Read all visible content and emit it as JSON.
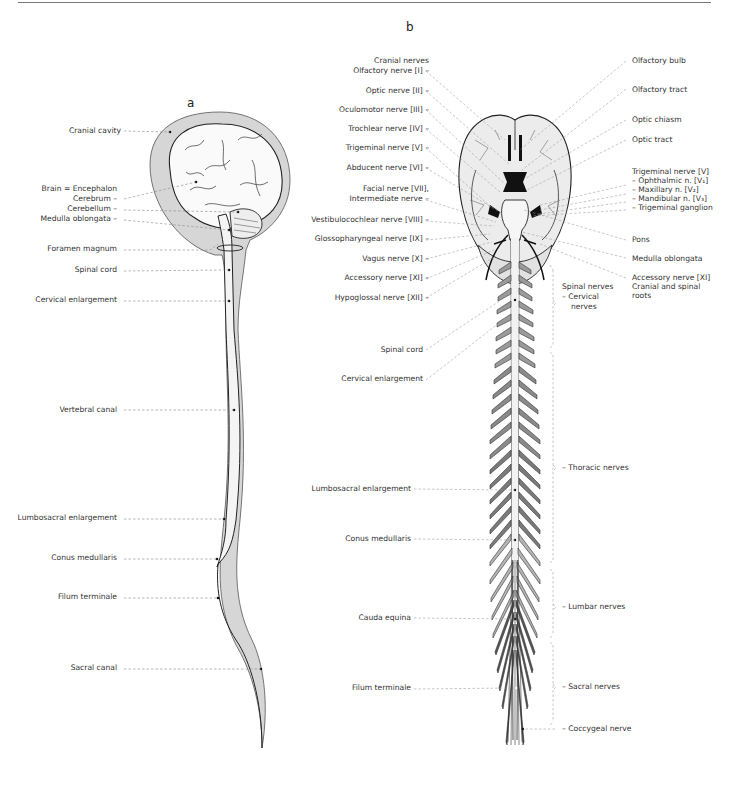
{
  "panels": {
    "a": {
      "letter": "a",
      "labels": {
        "cranial_cavity": "Cranial cavity",
        "brain": "Brain = Encephalon",
        "cerebrum": "Cerebrum –",
        "cerebellum": "Cerebellum –",
        "medulla_oblongata": "Medulla oblongata –",
        "foramen_magnum": "Foramen magnum",
        "spinal_cord": "Spinal cord",
        "cervical_enlargement": "Cervical enlargement",
        "vertebral_canal": "Vertebral canal",
        "lumbosacral_enlargement": "Lumbosacral enlargement",
        "conus_medullaris": "Conus medullaris",
        "filum_terminale": "Filum terminale",
        "sacral_canal": "Sacral canal"
      }
    },
    "b": {
      "letter": "b",
      "left_labels": {
        "cranial_nerves": "Cranial nerves",
        "olfactory": "Olfactory nerve [I] –",
        "optic": "Optic nerve [II] –",
        "oculomotor": "Oculomotor nerve [III] –",
        "trochlear": "Trochlear nerve [IV] –",
        "trigeminal": "Trigeminal nerve [V] –",
        "abducent": "Abducent nerve [VI] –",
        "facial": "Facial nerve [VII],",
        "intermediate": "Intermediate nerve –",
        "vestibulocochlear": "Vestibulocochlear nerve [VIII] –",
        "glossopharyngeal": "Glossopharyngeal nerve [IX] –",
        "vagus": "Vagus nerve [X] –",
        "accessory": "Accessory nerve [XI] –",
        "hypoglossal": "Hypoglossal nerve [XII] –",
        "spinal_cord": "Spinal cord",
        "cervical_enlargement": "Cervical enlargement",
        "lumbosacral_enlargement": "Lumbosacral enlargement",
        "conus_medullaris": "Conus medullaris",
        "cauda_equina": "Cauda equina",
        "filum_terminale": "Filum terminale"
      },
      "right_labels": {
        "olfactory_bulb": "Olfactory bulb",
        "olfactory_tract": "Olfactory tract",
        "optic_chiasm": "Optic chiasm",
        "optic_tract": "Optic tract",
        "trigeminal_nerve": "Trigeminal nerve [V]",
        "ophthalmic": "– Ophthalmic n. [V₁]",
        "maxillary": "– Maxillary n. [V₂]",
        "mandibular": "– Mandibular n. [V₃]",
        "trigeminal_ganglion": "– Trigeminal ganglion",
        "pons": "Pons",
        "medulla_oblongata": "Medulla oblongata",
        "accessory_nerve": "Accessory nerve [XI]",
        "cranial_spinal_roots_1": "Cranial and spinal",
        "cranial_spinal_roots_2": "roots",
        "spinal_nerves": "Spinal nerves",
        "cervical_1": "– Cervical",
        "cervical_2": "nerves",
        "thoracic": "– Thoracic nerves",
        "lumbar": "– Lumbar nerves",
        "sacral": "– Sacral nerves",
        "coccygeal": "– Coccygeal nerve"
      }
    }
  },
  "colors": {
    "line": "#222222",
    "leader": "#888888",
    "tissue_light": "#d4d4d4",
    "tissue_mid": "#8a8a8a",
    "tissue_dark": "#4a4a4a",
    "canal_fill": "#f2f2f2"
  }
}
